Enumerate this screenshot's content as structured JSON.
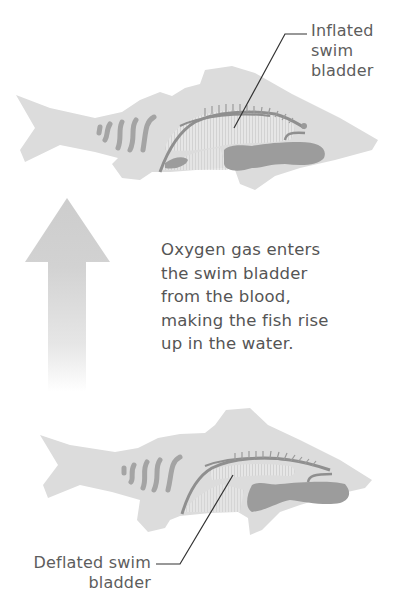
{
  "diagram": {
    "top_fish": {
      "state": "inflated",
      "label_lines": [
        "Inflated",
        "swim",
        "bladder"
      ]
    },
    "bottom_fish": {
      "state": "deflated",
      "label_lines": [
        "Deflated swim",
        "bladder"
      ]
    },
    "arrow": {
      "direction": "up",
      "icon": "up-arrow-icon"
    },
    "caption_lines": [
      "Oxygen gas enters",
      "the swim bladder",
      "from the blood,",
      "making the fish rise",
      "up in the water."
    ],
    "colors": {
      "background": "#ffffff",
      "fish_body": "#dcdcdc",
      "swim_bladder": "#e8e8e8",
      "organs": "#9c9c9c",
      "stripes": "#a4a4a4",
      "spine": "#8f8f8f",
      "arrow": "#cfcfcf",
      "leader_line": "#333333",
      "text": "#555555"
    }
  }
}
